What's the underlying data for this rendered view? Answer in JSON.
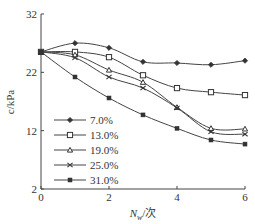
{
  "chart_data": {
    "type": "line",
    "title": "",
    "xlabel": "N_w/次",
    "xlabel_main": "N",
    "xlabel_sub": "w",
    "xlabel_unit": "/次",
    "ylabel": "c/kPa",
    "xlim": [
      0,
      6
    ],
    "ylim": [
      2,
      32
    ],
    "xticks": [
      0,
      2,
      4,
      6
    ],
    "yticks": [
      2,
      12,
      22,
      32
    ],
    "xtick_labels": [
      "0",
      "2",
      "4",
      "6"
    ],
    "ytick_labels": [
      "2",
      "12",
      "22",
      "32"
    ],
    "grid": false,
    "legend_position": "lower-left",
    "x": [
      0,
      1,
      2,
      3,
      4,
      5,
      6
    ],
    "series": [
      {
        "name": "7.0%",
        "marker": "diamond",
        "values": [
          25.5,
          27.0,
          26.2,
          23.8,
          23.6,
          23.3,
          24.0
        ]
      },
      {
        "name": "13.0%",
        "marker": "square",
        "values": [
          25.5,
          25.5,
          24.6,
          21.5,
          19.3,
          18.6,
          18.1
        ]
      },
      {
        "name": "19.0%",
        "marker": "triangle",
        "values": [
          25.5,
          25.0,
          22.4,
          20.3,
          16.0,
          12.4,
          12.3
        ]
      },
      {
        "name": "25.0%",
        "marker": "x",
        "values": [
          25.5,
          24.5,
          21.2,
          19.3,
          15.9,
          11.8,
          11.4
        ]
      },
      {
        "name": "31.0%",
        "marker": "filled-square",
        "values": [
          25.5,
          21.2,
          17.6,
          14.7,
          12.4,
          10.4,
          9.7
        ]
      }
    ]
  }
}
